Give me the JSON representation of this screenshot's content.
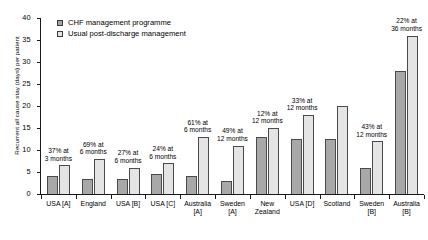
{
  "chart_data": {
    "type": "bar",
    "title": "",
    "xlabel": "",
    "ylabel": "Recurrent all cause stay (days) per patient",
    "ylim": [
      0,
      40
    ],
    "yticks": [
      0,
      5,
      10,
      15,
      20,
      25,
      30,
      35,
      40
    ],
    "grid": false,
    "legend_position": "top-left",
    "categories": [
      "USA [A]",
      "England",
      "USA [B]",
      "USA [C]",
      "Australia\n[A]",
      "Sweden\n[A]",
      "New\nZealand",
      "USA [D]",
      "Scotland",
      "Sweden\n[B]",
      "Australia\n[B]"
    ],
    "series": [
      {
        "name": "CHF management programme",
        "color": "#a8a8a8",
        "values": [
          4,
          3.5,
          3.5,
          4.5,
          4,
          3,
          13,
          12.5,
          12.5,
          6,
          28
        ]
      },
      {
        "name": "Usual post-discharge management",
        "color": "#e4e4e4",
        "values": [
          6.5,
          8,
          6,
          7,
          13,
          11,
          15,
          18,
          20,
          12,
          36
        ]
      }
    ],
    "annotations": [
      "37% at\n3 months",
      "69% at\n6 months",
      "27% at\n6 months",
      "24% at\n6 months",
      "61% at\n6 months",
      "49% at\n12 months",
      "12% at\n12 months",
      "33% at\n12 months",
      "",
      "43% at\n12 months",
      "22% at\n36 months"
    ]
  }
}
